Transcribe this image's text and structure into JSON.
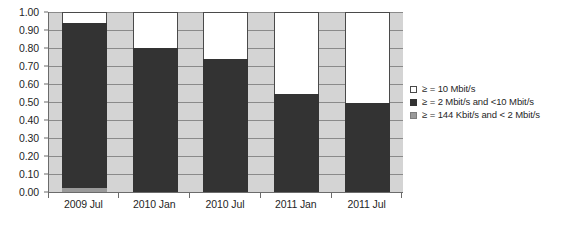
{
  "chart_data": {
    "type": "bar",
    "subtype": "stacked-bar",
    "title": "",
    "subtitle": "",
    "xlabel": "",
    "ylabel": "",
    "categories": [
      "2009 Jul",
      "2010 Jan",
      "2010 Jul",
      "2011 Jan",
      "2011 Jul"
    ],
    "series": [
      {
        "name": ">= 144 Kbit/s and < 2 Mbit/s",
        "swatch": "gray",
        "color": "#9a9a9a",
        "values": [
          0.02,
          0.0,
          0.0,
          0.0,
          0.0
        ]
      },
      {
        "name": ">= 2 Mbit/s and <10 Mbit/s",
        "swatch": "black",
        "color": "#333333",
        "values": [
          0.92,
          0.8,
          0.74,
          0.545,
          0.495
        ]
      },
      {
        "name": ">= 10 Mbit/s",
        "swatch": "white",
        "color": "#ffffff",
        "values": [
          0.06,
          0.2,
          0.26,
          0.455,
          0.505
        ]
      }
    ],
    "cumulative_tops": {
      "gray": [
        0.02,
        0.0,
        0.0,
        0.0,
        0.0
      ],
      "black": [
        0.94,
        0.8,
        0.74,
        0.545,
        0.495
      ],
      "white": [
        1.0,
        1.0,
        1.0,
        1.0,
        1.0
      ]
    },
    "ylim": [
      0.0,
      1.0
    ],
    "ytick_labels": [
      "1.00",
      "0.90",
      "0.80",
      "0.70",
      "0.60",
      "0.50",
      "0.40",
      "0.30",
      "0.20",
      "0.10",
      "0.00"
    ],
    "ytick_values": [
      1.0,
      0.9,
      0.8,
      0.7,
      0.6,
      0.5,
      0.4,
      0.3,
      0.2,
      0.1,
      0.0
    ],
    "grid": true,
    "grid_orientation": "horizontal",
    "legend_position": "right",
    "plot_background": "#d4d4d4",
    "axis_color": "#6b6b6b"
  },
  "legend": {
    "items": [
      {
        "label": "≥ = 10 Mbit/s",
        "swatch": "white"
      },
      {
        "label": "≥ = 2 Mbit/s and <10 Mbit/s",
        "swatch": "black"
      },
      {
        "label": "≥ = 144 Kbit/s and < 2 Mbit/s",
        "swatch": "gray"
      }
    ]
  }
}
